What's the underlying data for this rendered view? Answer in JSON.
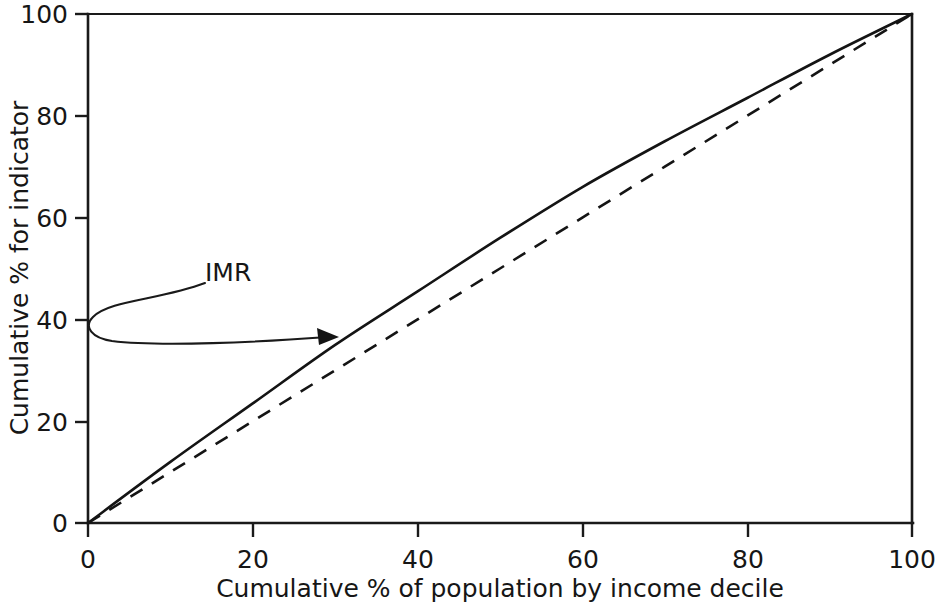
{
  "chart_data": {
    "type": "line",
    "title": "",
    "xlabel": "Cumulative % of population by income decile",
    "ylabel": "Cumulative % for indicator",
    "xlim": [
      0,
      100
    ],
    "ylim": [
      0,
      100
    ],
    "xticks": [
      0,
      20,
      40,
      60,
      80,
      100
    ],
    "yticks": [
      0,
      20,
      40,
      60,
      80,
      100
    ],
    "xticklabels": [
      "0",
      "20",
      "40",
      "60",
      "80",
      "100"
    ],
    "yticklabels": [
      "0",
      "20",
      "40",
      "60",
      "80",
      "100"
    ],
    "grid": false,
    "legend": "none",
    "series": [
      {
        "name": "IMR",
        "style": "solid",
        "x": [
          0,
          10,
          20,
          30,
          40,
          50,
          60,
          70,
          80,
          90,
          100
        ],
        "values": [
          0,
          12,
          23.5,
          35,
          45.5,
          56,
          66,
          75,
          83.5,
          92,
          100
        ]
      },
      {
        "name": "Line of equality",
        "style": "dashed",
        "x": [
          0,
          10,
          20,
          30,
          40,
          50,
          60,
          70,
          80,
          90,
          100
        ],
        "values": [
          0,
          10,
          20,
          30,
          40,
          50,
          60,
          70,
          80,
          90,
          100
        ]
      }
    ],
    "annotations": [
      {
        "label": "IMR",
        "label_x": 20,
        "label_y": 47,
        "target_x": 30,
        "target_y": 35.5,
        "style": "curved-leader-with-arrow"
      }
    ]
  },
  "colors": {
    "ink": "#141414",
    "background": "#ffffff"
  }
}
